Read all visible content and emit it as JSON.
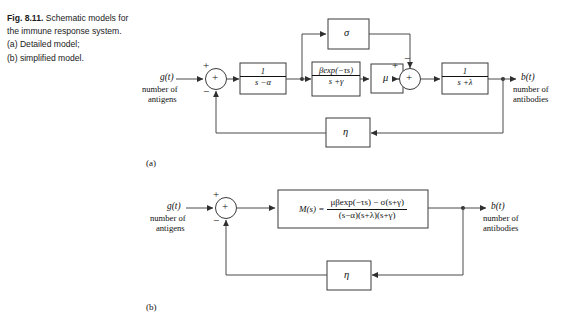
{
  "caption": {
    "fig_number": "Fig. 8.11.",
    "line1": "Schematic models for",
    "line2": "the immune response system.",
    "line3": "(a) Detailed model;",
    "line4": "(b) simplified model."
  },
  "part_labels": {
    "a": "(a)",
    "b": "(b)"
  },
  "diagram_a": {
    "input": {
      "signal": "g(t)",
      "description_line1": "number of",
      "description_line2": "antigens"
    },
    "output": {
      "signal": "b(t)",
      "description_line1": "number of",
      "description_line2": "antibodies"
    },
    "sum1": {
      "glyph": "+",
      "sign_top": "+",
      "sign_bottom": "−"
    },
    "sum2": {
      "glyph": "+",
      "sign_left": "+",
      "sign_top": "−"
    },
    "blocks": [
      {
        "name": "block-1-over-s-minus-alpha",
        "numerator": "1",
        "denominator": "s −α"
      },
      {
        "name": "block-beta-exp",
        "numerator": "βexp(−τs)",
        "denominator": "s +γ"
      },
      {
        "name": "block-mu",
        "label": "μ"
      },
      {
        "name": "block-sigma",
        "label": "σ"
      },
      {
        "name": "block-1-over-s-plus-lambda",
        "numerator": "1",
        "denominator": "s +λ"
      },
      {
        "name": "block-eta-feedback",
        "label": "η"
      }
    ]
  },
  "diagram_b": {
    "input": {
      "signal": "g(t)",
      "description_line1": "number of",
      "description_line2": "antigens"
    },
    "output": {
      "signal": "b(t)",
      "description_line1": "number of",
      "description_line2": "antibodies"
    },
    "sum": {
      "glyph": "+",
      "sign_top": "+",
      "sign_bottom": "−"
    },
    "transfer_block": {
      "name": "block-M-of-s",
      "lhs": "M(s) =",
      "numerator": "μβexp(−τs) − σ(s+γ)",
      "denominator": "(s−α)(s+λ)(s+γ)"
    },
    "feedback_block": {
      "name": "block-eta-feedback",
      "label": "η"
    }
  },
  "style": {
    "line_color": "#3a3a3a",
    "text_color": "#111111"
  }
}
